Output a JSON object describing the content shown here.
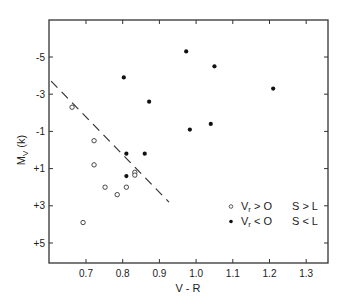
{
  "chart_data": {
    "type": "scatter",
    "title": "",
    "xlabel": "V - R",
    "ylabel": "M_V (k)",
    "xlim": [
      0.6,
      1.36
    ],
    "ylim": [
      6.0,
      -7.0
    ],
    "y_inverted": true,
    "grid": false,
    "x_ticks": [
      {
        "value": 0.7,
        "label": "0.7"
      },
      {
        "value": 0.8,
        "label": "0.8"
      },
      {
        "value": 0.9,
        "label": "0.9"
      },
      {
        "value": 1.0,
        "label": "1.0"
      },
      {
        "value": 1.1,
        "label": "1.1"
      },
      {
        "value": 1.2,
        "label": "1.2"
      },
      {
        "value": 1.3,
        "label": "1.3"
      }
    ],
    "y_ticks": [
      {
        "value": -5,
        "label": "-5"
      },
      {
        "value": -3,
        "label": "-3"
      },
      {
        "value": -1,
        "label": "-1"
      },
      {
        "value": 1,
        "label": "+1"
      },
      {
        "value": 3,
        "label": "+3"
      },
      {
        "value": 5,
        "label": "+5"
      }
    ],
    "series": [
      {
        "name": "V_r > 0   S > L",
        "marker": "open-circle",
        "points": [
          {
            "x": 0.662,
            "y": -2.3
          },
          {
            "x": 0.722,
            "y": -0.5
          },
          {
            "x": 0.722,
            "y": 0.8
          },
          {
            "x": 0.752,
            "y": 2.0
          },
          {
            "x": 0.785,
            "y": 2.4
          },
          {
            "x": 0.81,
            "y": 2.0
          },
          {
            "x": 0.833,
            "y": 1.2
          },
          {
            "x": 0.833,
            "y": 1.35
          },
          {
            "x": 0.692,
            "y": 3.9
          }
        ]
      },
      {
        "name": "V_r < 0   S < L",
        "marker": "filled-circle",
        "points": [
          {
            "x": 0.803,
            "y": -3.9
          },
          {
            "x": 0.872,
            "y": -2.6
          },
          {
            "x": 0.973,
            "y": -5.3
          },
          {
            "x": 1.05,
            "y": -4.5
          },
          {
            "x": 1.21,
            "y": -3.3
          },
          {
            "x": 0.983,
            "y": -1.1
          },
          {
            "x": 1.04,
            "y": -1.4
          },
          {
            "x": 0.81,
            "y": 0.2
          },
          {
            "x": 0.86,
            "y": 0.2
          },
          {
            "x": 0.81,
            "y": 1.4
          }
        ]
      }
    ],
    "annotations": [
      {
        "type": "dashed-line",
        "from": {
          "x": 0.605,
          "y": -3.7
        },
        "to": {
          "x": 0.926,
          "y": 2.8
        }
      }
    ],
    "legend": {
      "position": "lower-right",
      "entries": [
        {
          "marker": "open-circle",
          "label": "V",
          "sub": "r",
          "rel": "> O",
          "cond": "S > L"
        },
        {
          "marker": "filled-circle",
          "label": "V",
          "sub": "r",
          "rel": "< O",
          "cond": "S < L"
        }
      ]
    }
  },
  "axes": {
    "xlabel": "V - R",
    "ylabel_main": "M",
    "ylabel_sub": "V",
    "ylabel_suffix": " (k)"
  }
}
